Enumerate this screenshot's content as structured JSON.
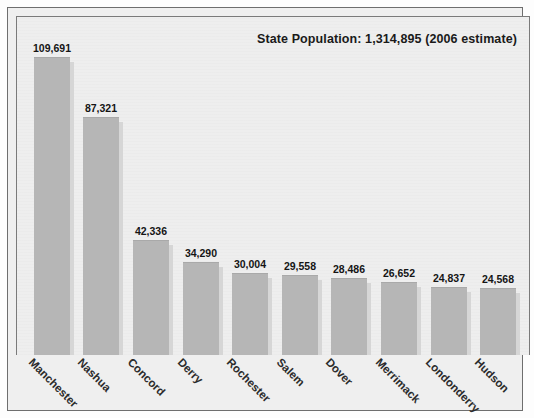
{
  "figure": {
    "title": "State Population: 1,314,895 (2006 estimate)",
    "background_color": "#eeeeee",
    "bar_color": "#b6b6b6",
    "bar_shadow_color": "#d6d6d6",
    "frame_color": "#6e6e6e",
    "text_color": "#151515"
  },
  "chart_data": {
    "type": "bar",
    "title": "State Population: 1,314,895 (2006 estimate)",
    "xlabel": "",
    "ylabel": "",
    "ylim": [
      0,
      120000
    ],
    "grid": false,
    "legend": "none",
    "orientation": "vertical",
    "value_labels": true,
    "xtick_rotation": 45,
    "categories": [
      "Manchester",
      "Nashua",
      "Concord",
      "Derry",
      "Rochester",
      "Salem",
      "Dover",
      "Merrimack",
      "Londonderry",
      "Hudson"
    ],
    "values": [
      109691,
      87321,
      42336,
      34290,
      30004,
      29558,
      28486,
      26652,
      24837,
      24568
    ],
    "value_text": [
      "109,691",
      "87,321",
      "42,336",
      "34,290",
      "30,004",
      "29,558",
      "28,486",
      "26,652",
      "24,837",
      "24,568"
    ],
    "annotations": [
      "State Population: 1,314,895 (2006 estimate)"
    ]
  }
}
